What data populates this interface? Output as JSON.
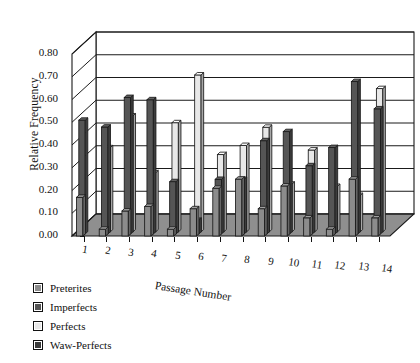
{
  "chart_data": {
    "type": "bar",
    "title": "",
    "xlabel": "Passage Number",
    "ylabel": "Relative Frequency",
    "ylim": [
      0.0,
      0.8
    ],
    "ytick_labels": [
      "0.00",
      "0.10",
      "0.20",
      "0.30",
      "0.40",
      "0.50",
      "0.60",
      "0.70",
      "0.80"
    ],
    "ytick_values": [
      0.0,
      0.1,
      0.2,
      0.3,
      0.4,
      0.5,
      0.6,
      0.7,
      0.8
    ],
    "grid": true,
    "projection": "3d",
    "legend_position": "bottom-left",
    "categories": [
      "1",
      "2",
      "3",
      "4",
      "5",
      "6",
      "7",
      "8",
      "9",
      "10",
      "11",
      "12",
      "13",
      "14"
    ],
    "series": [
      {
        "name": "Preterites",
        "color": "#8c8c8c",
        "values": [
          0.17,
          0.03,
          0.11,
          0.13,
          0.03,
          0.12,
          0.21,
          0.25,
          0.12,
          0.22,
          0.08,
          0.03,
          0.25,
          0.08
        ]
      },
      {
        "name": "Imperfects",
        "color": "#555555",
        "values": [
          0.5,
          0.47,
          0.6,
          0.59,
          0.23,
          0.06,
          0.24,
          0.24,
          0.41,
          0.45,
          0.3,
          0.38,
          0.67,
          0.55
        ]
      },
      {
        "name": "Perfects",
        "color": "#e8e8e8",
        "values": [
          0.0,
          0.37,
          0.51,
          0.26,
          0.48,
          0.69,
          0.34,
          0.38,
          0.46,
          0.21,
          0.36,
          0.2,
          0.16,
          0.63
        ]
      },
      {
        "name": "Waw-Perfects",
        "color": "#3a3a3a",
        "values": [
          0.0,
          0.0,
          0.0,
          0.0,
          0.0,
          0.0,
          0.0,
          0.0,
          0.0,
          0.0,
          0.0,
          0.0,
          0.0,
          0.0
        ]
      }
    ]
  },
  "legend": {
    "items": [
      {
        "label": "Preterites",
        "color": "#8c8c8c"
      },
      {
        "label": "Imperfects",
        "color": "#555555"
      },
      {
        "label": "Perfects",
        "color": "#e8e8e8"
      },
      {
        "label": "Waw-Perfects",
        "color": "#3a3a3a"
      }
    ]
  },
  "axes": {
    "y_title": "Relative Frequency",
    "x_title": "Passage Number"
  },
  "colors": {
    "floor": "#8f8f8f",
    "wall": "#ffffff",
    "outline": "#1a1a1a"
  }
}
